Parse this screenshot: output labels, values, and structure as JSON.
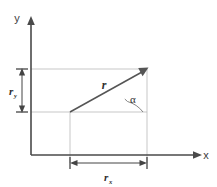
{
  "figure": {
    "background_color": "#ffffff",
    "axis_color": "#4a4a4a",
    "grid_color": "#b9b9b9",
    "vector_color": "#555555",
    "text_color": "#2e2e2e"
  },
  "axes": {
    "x_label": "x",
    "y_label": "y",
    "origin_px": {
      "x": 31,
      "y": 155
    }
  },
  "vector": {
    "label": "r",
    "tail_px": {
      "x": 70,
      "y": 112
    },
    "head_px": {
      "x": 147,
      "y": 69
    },
    "label_px": {
      "x": 104,
      "y": 85
    }
  },
  "angle": {
    "symbol": "α",
    "label_px": {
      "x": 132,
      "y": 99
    },
    "vertex_px": {
      "x": 147,
      "y": 112
    }
  },
  "components": {
    "x_component": {
      "label": "r",
      "subscript": "x",
      "dimension_line_y_px": 163,
      "from_x_px": 70,
      "to_x_px": 147,
      "label_px": {
        "x": 105,
        "y": 180
      }
    },
    "y_component": {
      "label": "r",
      "subscript": "y",
      "dimension_line_x_px": 22,
      "from_y_px": 69,
      "to_y_px": 112,
      "label_px": {
        "x": 12,
        "y": 94
      }
    }
  },
  "gridlines": {
    "horizontal": [
      {
        "y_px": 69,
        "from_x_px": 31,
        "to_x_px": 147
      },
      {
        "y_px": 112,
        "from_x_px": 31,
        "to_x_px": 147
      }
    ],
    "vertical": [
      {
        "x_px": 147,
        "from_y_px": 69,
        "to_y_px": 163
      },
      {
        "x_px": 70,
        "from_y_px": 112,
        "to_y_px": 163
      }
    ]
  }
}
